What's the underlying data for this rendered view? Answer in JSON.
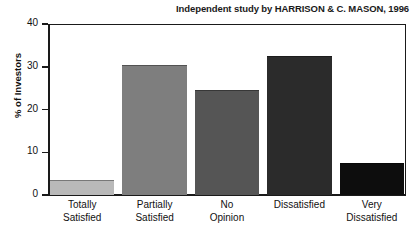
{
  "chart_data": {
    "type": "bar",
    "title": "Independent study by HARRISON & C. MASON, 1996",
    "xlabel": "",
    "ylabel": "% of Investors",
    "ylim": [
      0,
      40
    ],
    "yticks": [
      0,
      10,
      20,
      30,
      40
    ],
    "grid": false,
    "legend": "none",
    "categories": [
      "Totally Satisfied",
      "Partially Satisfied",
      "No Opinion",
      "Dissatisfied",
      "Very Dissatisfied"
    ],
    "category_lines": [
      [
        "Totally",
        "Satisfied"
      ],
      [
        "Partially",
        "Satisfied"
      ],
      [
        "No",
        "Opinion"
      ],
      [
        "Dissatisfied",
        ""
      ],
      [
        "Very",
        "Dissatisfied"
      ]
    ],
    "values": [
      3.5,
      30.5,
      24.5,
      32.5,
      7.5
    ],
    "bar_colors": [
      "#b9b9b9",
      "#7e7e7e",
      "#555555",
      "#2b2b2b",
      "#0d0d0d"
    ]
  },
  "ticklabels": {
    "t0": "0",
    "t10": "10",
    "t20": "20",
    "t30": "30",
    "t40": "40"
  }
}
